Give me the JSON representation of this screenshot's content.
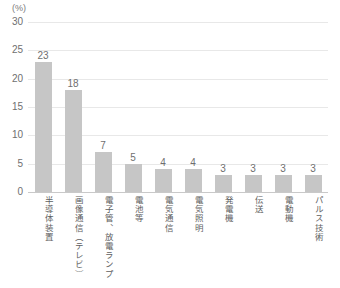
{
  "chart_data": {
    "type": "bar",
    "title": "",
    "subtitle": "",
    "unit_label": "(%)",
    "xlabel": "",
    "ylabel": "",
    "ylim": [
      0,
      30
    ],
    "ytick_values": [
      0,
      5,
      10,
      15,
      20,
      25,
      30
    ],
    "ytick_labels": [
      "0",
      "5",
      "10",
      "15",
      "20",
      "25",
      "30"
    ],
    "grid": true,
    "legend": false,
    "legend_position": "none",
    "bar_color": "#c6c6c6",
    "gridline_color": "#e8e8e8",
    "axis_color": "#c9c9c9",
    "text_color": "#6f6f6f",
    "categories": [
      "半導体装置",
      "画像通信（テレビ）",
      "電子管、放電ランプ",
      "電池等",
      "電気通信",
      "電気照明",
      "発電機",
      "伝送",
      "電動機",
      "パルス技術"
    ],
    "values": [
      23,
      18,
      7,
      5,
      4,
      4,
      3,
      3,
      3,
      3
    ],
    "value_labels": [
      "23",
      "18",
      "7",
      "5",
      "4",
      "4",
      "3",
      "3",
      "3",
      "3"
    ]
  }
}
